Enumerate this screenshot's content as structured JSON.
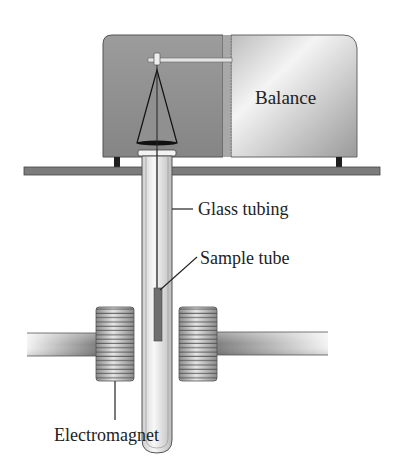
{
  "diagram": {
    "labels": {
      "balance": "Balance",
      "glass_tubing": "Glass tubing",
      "sample_tube": "Sample tube",
      "electromagnet": "Electromagnet"
    },
    "colors": {
      "balance_dark": "#8a8a8a",
      "balance_light": "#d8d8d8",
      "shelf": "#7a7a7a",
      "sample": "#6e6e6e",
      "outline": "#333333"
    }
  }
}
